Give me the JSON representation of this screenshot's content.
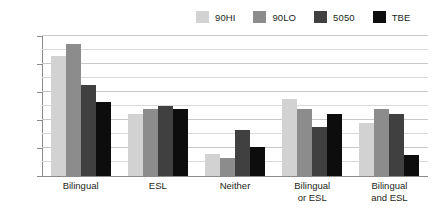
{
  "chart_data": {
    "type": "bar",
    "title": "",
    "subtitle": "",
    "xlabel": "",
    "ylabel": "",
    "ylim": [
      0,
      100
    ],
    "y_tick_labels": [
      "0%",
      "20%",
      "40%",
      "60%",
      "80%",
      "100%"
    ],
    "y_tick_values": [
      0,
      20,
      40,
      60,
      80,
      100
    ],
    "minor_gridline_values": [
      10,
      30,
      50,
      70,
      90
    ],
    "grid": true,
    "legend_position": "top-right",
    "categories": [
      "Bilingual",
      "ESL",
      "Neither",
      "Bilingual\nor ESL",
      "Bilingual\nand ESL"
    ],
    "series": [
      {
        "name": "90HI",
        "color": "#d2d2d2",
        "values": [
          86,
          44,
          16,
          55,
          38
        ]
      },
      {
        "name": "90LO",
        "color": "#8c8c8c",
        "values": [
          94,
          48,
          13,
          48,
          48
        ]
      },
      {
        "name": "5050",
        "color": "#404040",
        "values": [
          65,
          50,
          33,
          35,
          44
        ]
      },
      {
        "name": "TBE",
        "color": "#0d0d0d",
        "values": [
          53,
          48,
          21,
          44,
          15
        ]
      }
    ]
  },
  "axis": {
    "y_unit": "%",
    "baseline_label": "0%",
    "top_label": "100%"
  },
  "colors": {
    "grid": "#d9d9d9",
    "axis": "#8a8a8a",
    "text": "#231f20",
    "background": "#ffffff"
  }
}
